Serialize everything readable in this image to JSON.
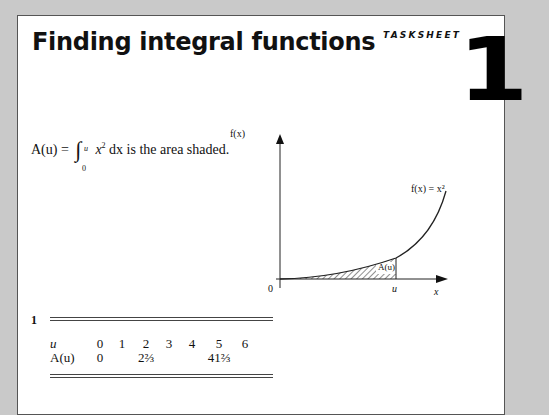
{
  "header": {
    "title": "Finding integral functions",
    "tag": "TASKSHEET",
    "number": "1"
  },
  "intro": {
    "lhs": "A(u) =",
    "upper_limit": "u",
    "lower_limit": "0",
    "integrand": "x",
    "power": "2",
    "dx": "dx",
    "rest": "is the area shaded."
  },
  "graph": {
    "y_label": "f(x)",
    "x_label": "x",
    "origin": "0",
    "u_label": "u",
    "curve_label": "f(x) = x²",
    "area_label": "A(u)"
  },
  "question": {
    "number": "1",
    "table": {
      "row1_label": "u",
      "row2_label": "A(u)",
      "u_values": [
        "0",
        "1",
        "2",
        "3",
        "4",
        "5",
        "6"
      ],
      "a_values": [
        "0",
        "",
        "2⅔",
        "",
        "",
        "41⅔",
        ""
      ]
    }
  }
}
